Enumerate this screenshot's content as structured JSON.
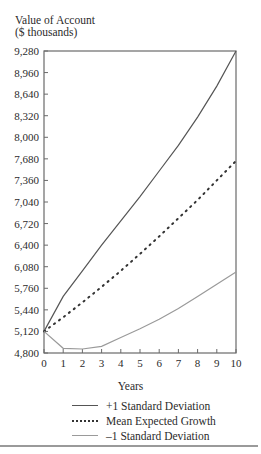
{
  "figure": {
    "ylabel_line1": "Value of Account",
    "ylabel_line2": "($ thousands)",
    "xlabel": "Years",
    "legend": [
      {
        "label": "+1 Standard Deviation",
        "style": "solid",
        "color": "#555555"
      },
      {
        "label": "Mean Expected Growth",
        "style": "dotted",
        "color": "#333333"
      },
      {
        "label": "–1 Standard Deviation",
        "style": "solid-light",
        "color": "#999999"
      }
    ]
  },
  "chart_data": {
    "type": "line",
    "title": "",
    "xlabel": "Years",
    "ylabel": "Value of Account ($ thousands)",
    "x": [
      0,
      1,
      2,
      3,
      4,
      5,
      6,
      7,
      8,
      9,
      10
    ],
    "xticks": [
      "0",
      "1",
      "2",
      "3",
      "4",
      "5",
      "6",
      "7",
      "8",
      "9",
      "10"
    ],
    "yticks": [
      "4,800",
      "5,120",
      "5,440",
      "5,760",
      "6,080",
      "6,400",
      "6,720",
      "7,040",
      "7,360",
      "7,680",
      "8,000",
      "8,320",
      "8,640",
      "8,960",
      "9,280"
    ],
    "xlim": [
      0,
      10
    ],
    "ylim": [
      4800,
      9280
    ],
    "grid": false,
    "legend_position": "bottom",
    "series": [
      {
        "name": "+1 Standard Deviation",
        "values": [
          5120,
          5640,
          6020,
          6400,
          6760,
          7120,
          7500,
          7880,
          8300,
          8760,
          9280
        ]
      },
      {
        "name": "Mean Expected Growth",
        "values": [
          5120,
          5330,
          5550,
          5780,
          6020,
          6270,
          6530,
          6800,
          7070,
          7360,
          7650
        ]
      },
      {
        "name": "–1 Standard Deviation",
        "values": [
          5120,
          4870,
          4860,
          4900,
          5030,
          5160,
          5300,
          5460,
          5640,
          5820,
          6000
        ]
      }
    ]
  }
}
